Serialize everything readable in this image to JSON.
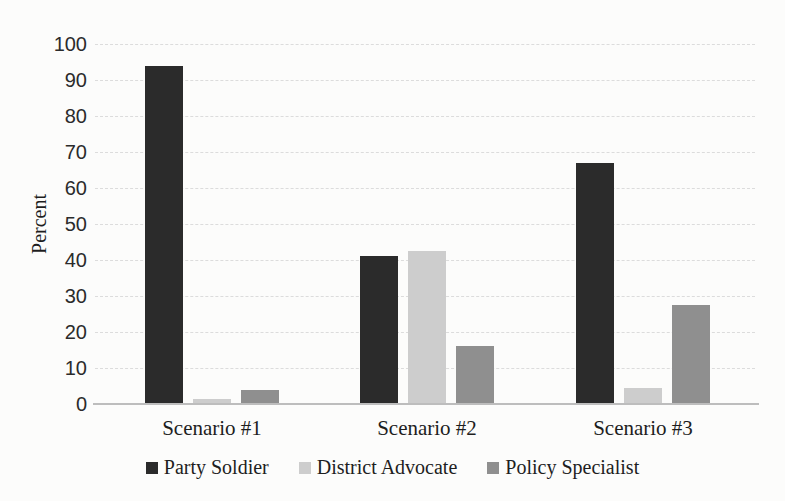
{
  "chart_data": {
    "type": "bar",
    "title": "",
    "xlabel": "",
    "ylabel": "Percent",
    "ylim": [
      0,
      100
    ],
    "yticks": [
      0,
      10,
      20,
      30,
      40,
      50,
      60,
      70,
      80,
      90,
      100
    ],
    "grid": "horizontal-dashed",
    "gridline_color": "#dcdcdc",
    "axis_line_color": "#bdbdbd",
    "legend_position": "bottom-center",
    "categories": [
      "Scenario #1",
      "Scenario #2",
      "Scenario #3"
    ],
    "series": [
      {
        "name": "Party Soldier",
        "color": "#2b2b2b",
        "values": [
          94,
          41,
          67
        ]
      },
      {
        "name": "District Advocate",
        "color": "#cdcdcd",
        "values": [
          1.5,
          42.5,
          4.5
        ]
      },
      {
        "name": "Policy Specialist",
        "color": "#8f8f8f",
        "values": [
          4,
          16,
          27.5
        ]
      }
    ]
  }
}
